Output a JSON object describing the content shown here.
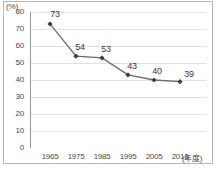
{
  "chart_data": {
    "type": "line",
    "title": "",
    "subtitle": "",
    "xlabel": "(年度)",
    "ylabel": "(%)",
    "categories": [
      "1965",
      "1975",
      "1985",
      "1995",
      "2005",
      "2013"
    ],
    "values": [
      73,
      54,
      53,
      43,
      40,
      39
    ],
    "series": [
      {
        "name": "",
        "values": [
          73,
          54,
          53,
          43,
          40,
          39
        ]
      }
    ],
    "data_labels": [
      "73",
      "54",
      "53",
      "43",
      "40",
      "39"
    ],
    "ylim": [
      0,
      80
    ],
    "xlim_categories": 6,
    "y_ticks": [
      "0",
      "10",
      "20",
      "30",
      "40",
      "50",
      "60",
      "70",
      "80"
    ],
    "y_tick_values": [
      0,
      10,
      20,
      30,
      40,
      50,
      60,
      70,
      80
    ],
    "x_ticks": [
      "1965",
      "1975",
      "1985",
      "1995",
      "2005",
      "2013"
    ],
    "grid": "horizontal",
    "legend": "none",
    "marker": "diamond",
    "line_color": "#6b6b6b",
    "marker_color": "#3d3d3d",
    "grid_color": "#d8d8d8",
    "axis_color": "#9a9a9a",
    "frame_color": "#b8b8b8",
    "text_color": "#4a4a4a"
  },
  "figure": {
    "y_axis_unit": "(%)",
    "x_axis_unit": "(年度)",
    "source_caption": ""
  }
}
